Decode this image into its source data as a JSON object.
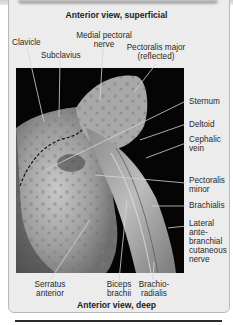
{
  "figure": {
    "top_caption": "Anterior view, superficial",
    "bottom_caption": "Anterior view, deep",
    "labels_top": [
      {
        "id": "clavicle",
        "text": "Clavicle"
      },
      {
        "id": "subclavius",
        "text": "Subclavius"
      },
      {
        "id": "medial_pectoral_nerve",
        "lines": [
          "Medial pectoral",
          "nerve"
        ]
      },
      {
        "id": "pectoralis_major",
        "lines": [
          "Pectoralis major",
          "(reflected)"
        ]
      }
    ],
    "labels_right": [
      {
        "id": "sternum",
        "lines": [
          "Sternum"
        ]
      },
      {
        "id": "deltoid",
        "lines": [
          "Deltoid"
        ]
      },
      {
        "id": "cephalic_vein",
        "lines": [
          "Cephalic",
          "vein"
        ]
      },
      {
        "id": "pectoralis_minor",
        "lines": [
          "Pectoralis",
          "minor"
        ]
      },
      {
        "id": "brachialis",
        "lines": [
          "Brachialis"
        ]
      },
      {
        "id": "lateral_antebrachial_cutaneous_nerve",
        "lines": [
          "Lateral",
          "ante-",
          "branchial",
          "cutaneous",
          "nerve"
        ]
      }
    ],
    "labels_bottom": [
      {
        "id": "serratus_anterior",
        "lines": [
          "Serratus",
          "anterior"
        ]
      },
      {
        "id": "biceps_brachii",
        "lines": [
          "Biceps",
          "brachii"
        ]
      },
      {
        "id": "brachioradialis",
        "lines": [
          "Brachio-",
          "radialis"
        ]
      }
    ],
    "colors": {
      "panel": "#ececec",
      "photo_bg": "#050505",
      "text": "#2a2a2a"
    }
  }
}
